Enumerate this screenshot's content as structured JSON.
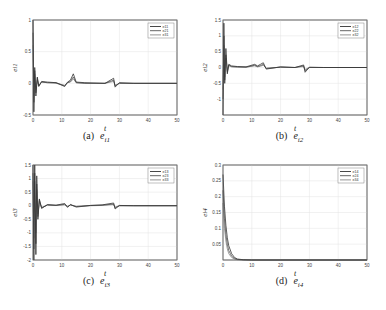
{
  "figure": {
    "panels": [
      {
        "id": "a",
        "caption_label": "(a)",
        "caption_var": "e_{i1}",
        "caption_text": "e i1"
      },
      {
        "id": "b",
        "caption_label": "(b)",
        "caption_var": "e_{i2}",
        "caption_text": "e i2"
      },
      {
        "id": "c",
        "caption_label": "(c)",
        "caption_var": "e_{i3}",
        "caption_text": "e i3"
      },
      {
        "id": "d",
        "caption_label": "(d)",
        "caption_var": "e_{i4}",
        "caption_text": "e i4"
      }
    ]
  },
  "chart_data": [
    {
      "type": "line",
      "title": "(a) e_i1",
      "xlabel": "t",
      "ylabel": "e_i1",
      "xlim": [
        0,
        50
      ],
      "ylim": [
        -0.5,
        1
      ],
      "xticks": [
        0,
        10,
        20,
        30,
        40,
        50
      ],
      "yticks": [
        -0.5,
        0,
        0.5,
        1
      ],
      "grid": true,
      "legend": {
        "position": "upper right",
        "entries": [
          "e_11",
          "e_21",
          "e_31"
        ]
      },
      "series": [
        {
          "name": "e_11",
          "x": [
            0,
            0.3,
            0.6,
            1,
            1.5,
            2,
            3,
            5,
            8,
            11,
            12,
            13,
            14,
            15,
            18,
            25,
            28,
            28.5,
            30,
            35,
            50
          ],
          "values": [
            1,
            -0.45,
            0.25,
            -0.2,
            0.1,
            -0.05,
            0.03,
            0.02,
            0.01,
            -0.05,
            0.02,
            0.05,
            0.15,
            0.02,
            0.01,
            0,
            0.08,
            -0.06,
            0.01,
            0,
            0
          ]
        },
        {
          "name": "e_21",
          "x": [
            0,
            0.3,
            0.6,
            1,
            1.5,
            2,
            3,
            5,
            8,
            11,
            12,
            13,
            14,
            15,
            18,
            25,
            28,
            28.5,
            30,
            35,
            50
          ],
          "values": [
            0.8,
            -0.3,
            0.2,
            -0.15,
            0.08,
            -0.04,
            0.02,
            0.01,
            0.01,
            -0.04,
            0.01,
            0.03,
            0.1,
            0.01,
            0,
            0,
            0.05,
            -0.04,
            0,
            0,
            0
          ]
        },
        {
          "name": "e_31",
          "x": [
            0,
            0.3,
            0.6,
            1,
            1.5,
            2,
            3,
            5,
            8,
            11,
            12,
            13,
            14,
            15,
            18,
            25,
            28,
            28.5,
            30,
            35,
            50
          ],
          "values": [
            0.6,
            -0.2,
            0.15,
            -0.1,
            0.05,
            -0.03,
            0.02,
            0.01,
            0,
            -0.03,
            0.01,
            0.02,
            0.07,
            0.01,
            0,
            0,
            0.03,
            -0.03,
            0,
            0,
            0
          ]
        }
      ]
    },
    {
      "type": "line",
      "title": "(b) e_i2",
      "xlabel": "t",
      "ylabel": "e_i2",
      "xlim": [
        0,
        50
      ],
      "ylim": [
        -1.5,
        1.5
      ],
      "xticks": [
        0,
        10,
        20,
        30,
        40,
        50
      ],
      "yticks": [
        -1,
        -0.5,
        0,
        0.5,
        1,
        1.5
      ],
      "grid": true,
      "legend": {
        "position": "upper right",
        "entries": [
          "e_12",
          "e_22",
          "e_32"
        ]
      },
      "series": [
        {
          "name": "e_12",
          "x": [
            0,
            0.3,
            0.6,
            1,
            1.5,
            2,
            3,
            5,
            8,
            11,
            12,
            13,
            14,
            15,
            20,
            25,
            28,
            28.5,
            30,
            35,
            50
          ],
          "values": [
            -1.5,
            1.4,
            -0.5,
            0.6,
            -0.2,
            0.1,
            0.05,
            0.03,
            0.02,
            0.1,
            0.05,
            0.1,
            0.15,
            -0.05,
            0.02,
            0,
            0.08,
            -0.15,
            0.01,
            0,
            0
          ]
        },
        {
          "name": "e_22",
          "x": [
            0,
            0.3,
            0.6,
            1,
            1.5,
            2,
            3,
            5,
            8,
            11,
            12,
            13,
            14,
            15,
            20,
            25,
            28,
            28.5,
            30,
            35,
            50
          ],
          "values": [
            -1,
            1,
            -0.4,
            0.4,
            -0.15,
            0.08,
            0.03,
            0.02,
            0.01,
            0.07,
            0.03,
            0.06,
            0.1,
            -0.03,
            0.01,
            0,
            0.05,
            -0.1,
            0,
            0,
            0
          ]
        },
        {
          "name": "e_32",
          "x": [
            0,
            0.3,
            0.6,
            1,
            1.5,
            2,
            3,
            5,
            8,
            11,
            12,
            13,
            14,
            15,
            20,
            25,
            28,
            28.5,
            30,
            35,
            50
          ],
          "values": [
            -0.7,
            0.7,
            -0.3,
            0.3,
            -0.1,
            0.05,
            0.02,
            0.01,
            0.01,
            0.05,
            0.02,
            0.04,
            0.07,
            -0.02,
            0.01,
            0,
            0.03,
            -0.06,
            0,
            0,
            0
          ]
        }
      ]
    },
    {
      "type": "line",
      "title": "(c) e_i3",
      "xlabel": "t",
      "ylabel": "e_i3",
      "xlim": [
        0,
        50
      ],
      "ylim": [
        -2,
        1.5
      ],
      "xticks": [
        0,
        10,
        20,
        30,
        40,
        50
      ],
      "yticks": [
        -2,
        -1.5,
        -1,
        -0.5,
        0,
        0.5,
        1,
        1.5
      ],
      "grid": true,
      "legend": {
        "position": "upper right",
        "entries": [
          "e_13",
          "e_23",
          "e_33"
        ]
      },
      "series": [
        {
          "name": "e_13",
          "x": [
            0,
            0.3,
            0.6,
            1,
            1.3,
            1.7,
            2.2,
            3,
            5,
            8,
            11,
            12,
            13,
            15,
            20,
            24,
            28,
            28.5,
            30,
            35,
            50
          ],
          "values": [
            1.5,
            -2,
            1.5,
            -1.8,
            1.1,
            -0.5,
            0.25,
            -0.1,
            0.04,
            0.02,
            0.08,
            -0.06,
            0.05,
            -0.05,
            0.01,
            0.03,
            0.1,
            -0.12,
            0.01,
            0,
            0
          ]
        },
        {
          "name": "e_23",
          "x": [
            0,
            0.3,
            0.6,
            1,
            1.3,
            1.7,
            2.2,
            3,
            5,
            8,
            11,
            12,
            13,
            15,
            20,
            24,
            28,
            28.5,
            30,
            35,
            50
          ],
          "values": [
            1.2,
            -1.6,
            1.2,
            -1.4,
            0.8,
            -0.4,
            0.2,
            -0.08,
            0.03,
            0.01,
            0.05,
            -0.04,
            0.03,
            -0.03,
            0.01,
            0.02,
            0.06,
            -0.08,
            0,
            0,
            0
          ]
        },
        {
          "name": "e_33",
          "x": [
            0,
            0.3,
            0.6,
            1,
            1.3,
            1.7,
            2.2,
            3,
            5,
            8,
            11,
            12,
            13,
            15,
            20,
            24,
            28,
            28.5,
            30,
            35,
            50
          ],
          "values": [
            0.9,
            -1.2,
            0.9,
            -1,
            0.6,
            -0.3,
            0.15,
            -0.06,
            0.02,
            0.01,
            0.03,
            -0.02,
            0.02,
            -0.02,
            0,
            0.01,
            0.04,
            -0.05,
            0,
            0,
            0
          ]
        }
      ]
    },
    {
      "type": "line",
      "title": "(d) e_i4",
      "xlabel": "t",
      "ylabel": "e_i4",
      "xlim": [
        0,
        50
      ],
      "ylim": [
        0,
        0.3
      ],
      "xticks": [
        0,
        10,
        20,
        30,
        40,
        50
      ],
      "yticks": [
        0.05,
        0.1,
        0.15,
        0.2,
        0.25,
        0.3
      ],
      "grid": true,
      "legend": {
        "position": "upper right",
        "entries": [
          "e_14",
          "e_24",
          "e_34"
        ]
      },
      "series": [
        {
          "name": "e_14",
          "x": [
            0,
            0.5,
            1,
            1.5,
            2,
            3,
            4,
            5,
            7,
            10,
            50
          ],
          "values": [
            0.27,
            0.17,
            0.11,
            0.07,
            0.045,
            0.02,
            0.008,
            0.003,
            0.001,
            0,
            0
          ]
        },
        {
          "name": "e_24",
          "x": [
            0,
            0.5,
            1,
            1.5,
            2,
            3,
            4,
            5,
            7,
            10,
            50
          ],
          "values": [
            0.22,
            0.13,
            0.08,
            0.05,
            0.03,
            0.012,
            0.005,
            0.002,
            0.0005,
            0,
            0
          ]
        },
        {
          "name": "e_34",
          "x": [
            0,
            0.5,
            1,
            1.5,
            2,
            3,
            4,
            5,
            7,
            10,
            50
          ],
          "values": [
            0.18,
            0.1,
            0.06,
            0.035,
            0.02,
            0.008,
            0.003,
            0.001,
            0,
            0,
            0
          ]
        }
      ]
    }
  ],
  "style": {
    "line_colors": [
      "#333333",
      "#555555",
      "#888888"
    ],
    "grid_color": "#e3e3e3",
    "axis_color": "#555555"
  }
}
